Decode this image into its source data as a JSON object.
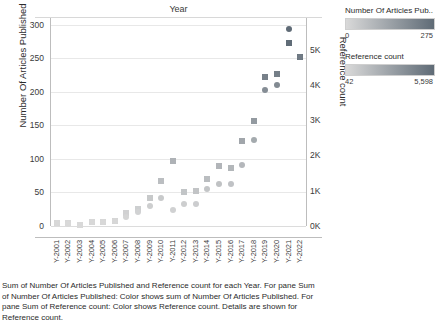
{
  "chart": {
    "title": "Year",
    "y_left_title": "Number Of Articles Published",
    "y_right_title": "Reference count",
    "y_left_ticks": [
      "300",
      "250",
      "200",
      "150",
      "100",
      "50",
      "0"
    ],
    "y_right_ticks": [
      "5K",
      "4K",
      "3K",
      "2K",
      "1K",
      "0K"
    ]
  },
  "legend": {
    "articles": {
      "title": "Number Of Articles Pub..",
      "min": "0",
      "max": "275",
      "color_min": "#d9d9d9",
      "color_max": "#5f6b76"
    },
    "references": {
      "title": "Reference count",
      "min": "42",
      "max": "5,598",
      "color_min": "#d9d9d9",
      "color_max": "#5f6b76"
    }
  },
  "caption": "Sum of Number Of Articles Published and Reference count for each Year. For pane Sum of Number Of Articles Published: Color shows sum of Number Of Articles Published. For pane Sum of Reference count: Color shows Reference count. Details are shown for Reference count.",
  "chart_data": {
    "type": "scatter",
    "title": "Year",
    "xlabel": "Year",
    "ylabel": "Number Of Articles Published",
    "y2label": "Reference count",
    "ylim": [
      0,
      310
    ],
    "y2lim": [
      0,
      5900
    ],
    "grid": true,
    "legend_position": "right",
    "categories": [
      "Y-2001",
      "Y-2002",
      "Y-2003",
      "Y-2004",
      "Y-2005",
      "Y-2006",
      "Y-2007",
      "Y-2008",
      "Y-2009",
      "Y-2010",
      "Y-2011",
      "Y-2012",
      "Y-2013",
      "Y-2014",
      "Y-2015",
      "Y-2016",
      "Y-2017",
      "Y-2018",
      "Y-2019",
      "Y-2020",
      "Y-2021",
      "Y-2022"
    ],
    "series": [
      {
        "name": "Number Of Articles Published",
        "marker": "square",
        "axis": "left",
        "values": [
          5,
          5,
          2,
          6,
          6,
          8,
          19,
          26,
          41,
          67,
          97,
          51,
          52,
          70,
          89,
          86,
          127,
          157,
          222,
          226,
          272,
          252
        ]
      },
      {
        "name": "Reference count",
        "marker": "circle",
        "axis": "right",
        "values": [
          88,
          60,
          42,
          105,
          110,
          150,
          245,
          390,
          580,
          800,
          455,
          610,
          625,
          1060,
          1195,
          1190,
          1740,
          2440,
          3870,
          4010,
          5598,
          4780
        ]
      }
    ]
  }
}
